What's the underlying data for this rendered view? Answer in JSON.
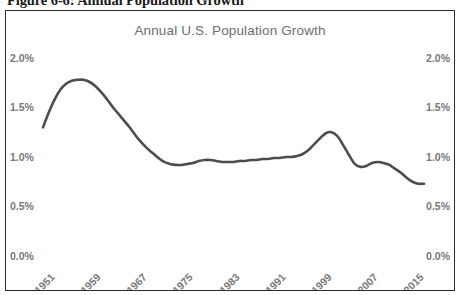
{
  "figure": {
    "caption": "Figure 6-6: Annual Population Growth"
  },
  "chart": {
    "title": "Annual U.S. Population Growth",
    "line_color": "#4d4d4d",
    "axis_label_color": "#777777",
    "border_color": "#2b2b2b",
    "y_ticks_left": [
      "2.0%",
      "1.5%",
      "1.0%",
      "0.5%",
      "0.0%"
    ],
    "y_ticks_right": [
      "2.0%",
      "1.5%",
      "1.0%",
      "0.5%",
      "0.0%"
    ],
    "x_ticks": [
      "1951",
      "1959",
      "1967",
      "1975",
      "1983",
      "1991",
      "1999",
      "2007",
      "2015"
    ]
  },
  "chart_data": {
    "type": "line",
    "title": "Annual U.S. Population Growth",
    "xlabel": "",
    "ylabel": "",
    "ylim": [
      0.0,
      2.0
    ],
    "xlim": [
      1950,
      2016
    ],
    "grid": false,
    "legend": "none",
    "y_tick_values": [
      0.0,
      0.5,
      1.0,
      1.5,
      2.0
    ],
    "y_tick_labels": [
      "0.0%",
      "0.5%",
      "1.0%",
      "1.5%",
      "2.0%"
    ],
    "y_axis_positions": [
      "left",
      "right"
    ],
    "x_tick_values": [
      1951,
      1959,
      1967,
      1975,
      1983,
      1991,
      1999,
      2007,
      2015
    ],
    "x_tick_labels": [
      "1951",
      "1959",
      "1967",
      "1975",
      "1983",
      "1991",
      "1999",
      "2007",
      "2015"
    ],
    "x_tick_rotation": -45,
    "units": "percent",
    "series": [
      {
        "name": "Annual U.S. Population Growth",
        "color": "#4d4d4d",
        "x": [
          1950,
          1951,
          1952,
          1953,
          1954,
          1955,
          1956,
          1957,
          1958,
          1959,
          1960,
          1961,
          1962,
          1963,
          1964,
          1965,
          1966,
          1967,
          1968,
          1969,
          1970,
          1971,
          1972,
          1973,
          1974,
          1975,
          1976,
          1977,
          1978,
          1979,
          1980,
          1981,
          1982,
          1983,
          1984,
          1985,
          1986,
          1987,
          1988,
          1989,
          1990,
          1991,
          1992,
          1993,
          1994,
          1995,
          1996,
          1997,
          1998,
          1999,
          2000,
          2001,
          2002,
          2003,
          2004,
          2005,
          2006,
          2007,
          2008,
          2009,
          2010,
          2011,
          2012,
          2013,
          2014,
          2015,
          2016
        ],
        "values": [
          1.3,
          1.45,
          1.58,
          1.68,
          1.74,
          1.77,
          1.78,
          1.78,
          1.76,
          1.72,
          1.66,
          1.59,
          1.51,
          1.44,
          1.37,
          1.3,
          1.22,
          1.15,
          1.09,
          1.04,
          0.99,
          0.95,
          0.93,
          0.92,
          0.92,
          0.93,
          0.94,
          0.96,
          0.97,
          0.97,
          0.96,
          0.95,
          0.95,
          0.95,
          0.96,
          0.96,
          0.97,
          0.97,
          0.98,
          0.98,
          0.99,
          0.99,
          1.0,
          1.0,
          1.01,
          1.03,
          1.07,
          1.13,
          1.19,
          1.24,
          1.25,
          1.21,
          1.12,
          1.02,
          0.93,
          0.9,
          0.91,
          0.94,
          0.95,
          0.94,
          0.92,
          0.88,
          0.84,
          0.79,
          0.75,
          0.73,
          0.73
        ]
      }
    ]
  }
}
